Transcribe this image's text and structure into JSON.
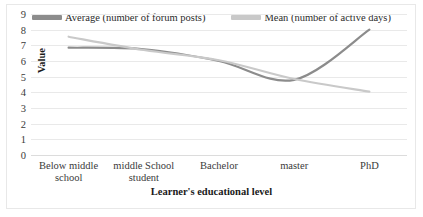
{
  "chart_data": {
    "type": "line",
    "title": "",
    "xlabel": "Learner's educational level",
    "ylabel": "Value",
    "categories": [
      "Below middle school",
      "middle School student",
      "Bachelor",
      "master",
      "PhD"
    ],
    "series": [
      {
        "name": "Average (number of forum posts)",
        "color": "#8c8c8c",
        "values": [
          6.85,
          6.75,
          6.0,
          4.8,
          8.0
        ]
      },
      {
        "name": "Mean (number of active days)",
        "color": "#c9c9c9",
        "values": [
          7.55,
          6.7,
          6.05,
          4.85,
          4.05
        ]
      }
    ],
    "ylim": [
      0,
      9
    ],
    "ystep": 1,
    "yticks": [
      "9",
      "8",
      "7",
      "6",
      "5",
      "4",
      "3",
      "2",
      "1",
      "0"
    ],
    "grid": true,
    "smooth": true,
    "legend_position": "top"
  },
  "frame": {
    "border_color": "#e8e8e8",
    "gridline_color": "#e9e9e9",
    "background": "#ffffff"
  }
}
